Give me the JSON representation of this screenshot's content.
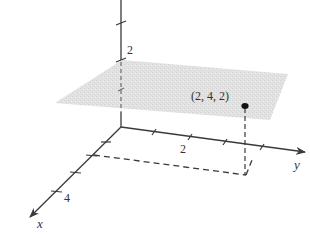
{
  "figure": {
    "type": "3d-coordinate-diagram",
    "axes": {
      "x": {
        "label": "x",
        "tick_label": "4"
      },
      "y": {
        "label": "y",
        "tick_label": "2"
      },
      "z": {
        "tick_label": "2"
      }
    },
    "point": {
      "label": "(2, 4, 2)",
      "coords": [
        2,
        4,
        2
      ]
    },
    "plane": {
      "equation": "z = 2",
      "color": "#dcdcdc"
    },
    "colors": {
      "axis": "#3a3a3a",
      "dashed": "#3a3a3a",
      "point": "#111111",
      "text": "#333333"
    }
  }
}
